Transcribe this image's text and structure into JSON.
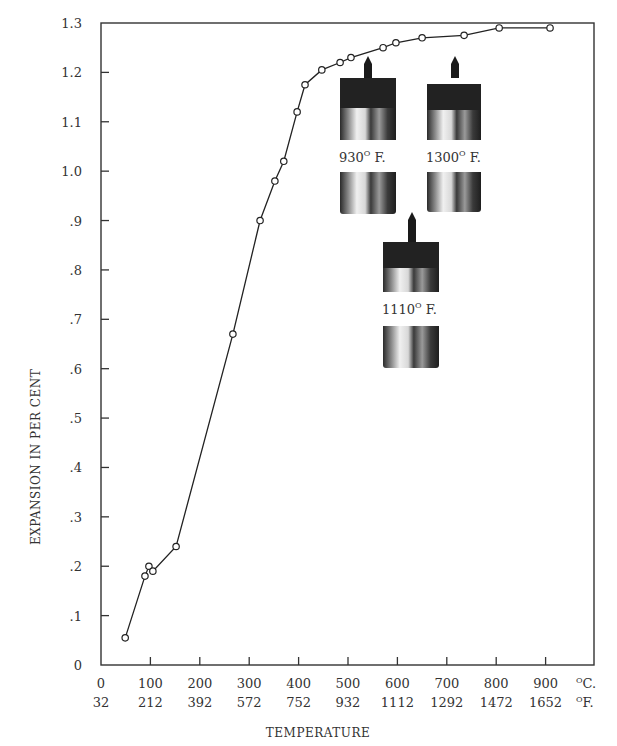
{
  "chart_data": {
    "type": "line",
    "title": "",
    "xlabel": "TEMPERATURE",
    "ylabel": "EXPANSION IN PER CENT",
    "x_unit_primary": "°C.",
    "x_unit_secondary": "°F.",
    "xlim": [
      0,
      1000
    ],
    "ylim": [
      0,
      1.3
    ],
    "grid": false,
    "legend": null,
    "x_ticks_c": [
      "0",
      "100",
      "200",
      "300",
      "400",
      "500",
      "600",
      "700",
      "800",
      "900"
    ],
    "x_ticks_f": [
      "32",
      "212",
      "392",
      "572",
      "752",
      "932",
      "1112",
      "1292",
      "1472",
      "1652"
    ],
    "y_ticks": [
      "0",
      ".1",
      ".2",
      ".3",
      ".4",
      ".5",
      ".6",
      ".7",
      ".8",
      ".9",
      "1.0",
      "1.1",
      "1.2",
      "1.3"
    ],
    "series": [
      {
        "name": "Expansion",
        "marker": "open-circle",
        "x": [
          49,
          89,
          97,
          105,
          152,
          267,
          322,
          352,
          370,
          397,
          413,
          447,
          484,
          506,
          571,
          597,
          650,
          735,
          806,
          909
        ],
        "y": [
          0.055,
          0.18,
          0.2,
          0.19,
          0.24,
          0.67,
          0.9,
          0.98,
          1.02,
          1.12,
          1.175,
          1.205,
          1.22,
          1.23,
          1.25,
          1.26,
          1.27,
          1.275,
          1.29,
          1.29
        ]
      }
    ],
    "annotations": [
      {
        "type": "photo",
        "label": "930° F.",
        "label_num": "930",
        "label_unit": "F."
      },
      {
        "type": "photo",
        "label": "1300° F.",
        "label_num": "1300",
        "label_unit": "F."
      },
      {
        "type": "photo",
        "label": "1110° F.",
        "label_num": "1110",
        "label_unit": "F."
      }
    ]
  }
}
